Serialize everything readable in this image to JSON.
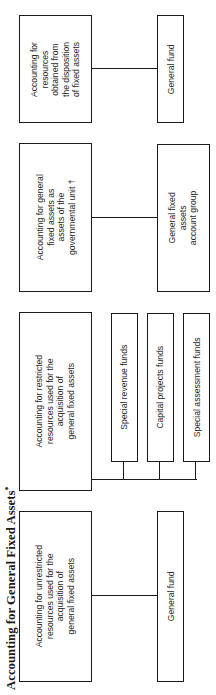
{
  "title": {
    "text": "Accounting for General Fixed Assets",
    "footnote_mark": "*"
  },
  "diagram": {
    "orientation": "rotated-90-ccw",
    "groups": [
      {
        "id": "unrestricted",
        "purpose": "Accounting for unrestricted\nresources used for the\nacquisition of\ngeneral fixed assets",
        "funds": [
          "General fund"
        ]
      },
      {
        "id": "restricted",
        "purpose": "Accounting for restricted\nresources used for the\nacquisition of\ngeneral fixed assets",
        "funds": [
          "Special revenue funds",
          "Capital projects funds",
          "Special assessment funds"
        ]
      },
      {
        "id": "governmental-unit",
        "purpose": "Accounting for general\nfixed assets as\nassets of the\ngovernmental unit †",
        "funds": [
          "General fixed\nassets\naccount group"
        ]
      },
      {
        "id": "disposition",
        "purpose": "Accounting for\nresources\nobtained from\nthe disposition\nof fixed assets",
        "funds": [
          "General fund"
        ]
      }
    ]
  },
  "colors": {
    "line": "#1a1a1a",
    "background": "#ffffff",
    "text": "#1f1f1f"
  }
}
